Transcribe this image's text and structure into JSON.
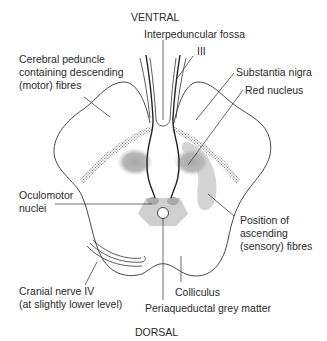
{
  "orientation": {
    "top": "VENTRAL",
    "bottom": "DORSAL"
  },
  "labels": {
    "interpeduncular_fossa": "Interpeduncular fossa",
    "cn3": "III",
    "cerebral_peduncle": [
      "Cerebral peduncle",
      "containing descending",
      "(motor) fibres"
    ],
    "substantia_nigra": "Substantia nigra",
    "red_nucleus": "Red nucleus",
    "oculomotor_nuclei": [
      "Oculomotor",
      "nuclei"
    ],
    "ascending_fibres": [
      "Position of",
      "ascending",
      "(sensory) fibres"
    ],
    "cranial_nerve_iv": [
      "Cranial nerve IV",
      "(at slightly lower level)"
    ],
    "colliculus": "Colliculus",
    "periaqueductal": "Periaqueductal grey matter"
  },
  "colors": {
    "outline": "#333333",
    "shading": "#c8c8c8",
    "dark_shading": "#b4b4b4",
    "leader_line": "#444444",
    "text": "#2a2a2a"
  }
}
